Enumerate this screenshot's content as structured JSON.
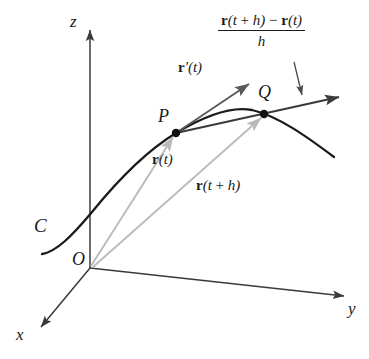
{
  "figure": {
    "background_color": "#ffffff",
    "curve_color": "#1a1a1a",
    "axis_color": "#3a3a3a",
    "position_vector_color": "#b9b9b9",
    "tangent_color": "#555555",
    "secant_color": "#3a3a3a"
  },
  "axes": {
    "x_label": "x",
    "y_label": "y",
    "z_label": "z"
  },
  "points": {
    "origin_label": "O",
    "p_label": "P",
    "q_label": "Q"
  },
  "curve": {
    "label": "C"
  },
  "vectors": {
    "position_t": "r(t)",
    "position_t_plus_h": "r(t + h)",
    "tangent": "r′(t)"
  },
  "quotient": {
    "numerator_bold_r1": "r",
    "numerator_arg1": "(t + h)",
    "numerator_minus": "−",
    "numerator_bold_r2": "r",
    "numerator_arg2": "(t)",
    "denominator": "h",
    "full_text": "[r(t + h) − r(t)] / h"
  }
}
